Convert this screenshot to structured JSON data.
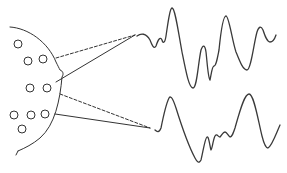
{
  "diagram": {
    "description": "Scalp electrodes on a head outline connected to two EEG waveform traces",
    "colors": {
      "line": "#333333",
      "background": "#ffffff"
    },
    "head": {
      "outline_path": "M10,27 C28,28 48,42 56,62 C58,66 59,68 60,70 C63,71 64,74 62,77 C60,100 55,125 40,138 C33,144 25,148 18,151"
    },
    "electrodes": [
      {
        "cx": 18,
        "cy": 44
      },
      {
        "cx": 28,
        "cy": 61
      },
      {
        "cx": 43,
        "cy": 59
      },
      {
        "cx": 30,
        "cy": 88
      },
      {
        "cx": 47,
        "cy": 88
      },
      {
        "cx": 14,
        "cy": 115
      },
      {
        "cx": 31,
        "cy": 115
      },
      {
        "cx": 45,
        "cy": 114
      },
      {
        "cx": 22,
        "cy": 129
      }
    ],
    "connections": [
      {
        "name": "top-dashed",
        "x1": 56,
        "y1": 58,
        "x2": 135,
        "y2": 35,
        "style": "dashed"
      },
      {
        "name": "top-solid",
        "x1": 56,
        "y1": 82,
        "x2": 135,
        "y2": 35,
        "style": "solid"
      },
      {
        "name": "bottom-dashed",
        "x1": 60,
        "y1": 94,
        "x2": 150,
        "y2": 128,
        "style": "dashed"
      },
      {
        "name": "bottom-solid",
        "x1": 55,
        "y1": 114,
        "x2": 150,
        "y2": 128,
        "style": "solid"
      }
    ],
    "waveforms": [
      {
        "name": "top-waveform",
        "path": "M137,36 C141,33 146,33 150,40 C152,45 154,50 156,46 C158,40 160,36 162,40 C163,44 165,43 166,36 C168,22 170,8 172,8 C175,8 178,30 182,52 C186,72 189,88 193,88 C197,88 198,64 201,50 C203,44 205,45 206,52 C207,60 208,78 210,80 C211,76 212,66 214,66 C216,66 217,60 219,50 C221,30 223,16 226,16 C229,16 232,40 236,52 C240,62 243,70 247,70 C251,70 254,42 257,32 C259,26 261,26 263,30 C265,36 267,42 270,42 C273,42 275,38 276,35"
      },
      {
        "name": "bottom-waveform",
        "path": "M155,130 C157,132 159,133 161,128 C163,118 166,104 169,98 C171,95 173,99 176,108 C181,124 188,145 195,158 C197,162 199,164 201,160 C203,152 205,138 207,137 C209,136 210,148 211,150 C212,150 213,140 215,136 C217,133 218,137 220,137 C222,135 223,132 225,132 C227,132 228,136 230,137 C232,137 233,134 235,128 C239,114 244,94 249,94 C254,94 258,120 262,136 C264,144 266,148 268,148 C272,146 276,134 280,125"
      }
    ]
  }
}
